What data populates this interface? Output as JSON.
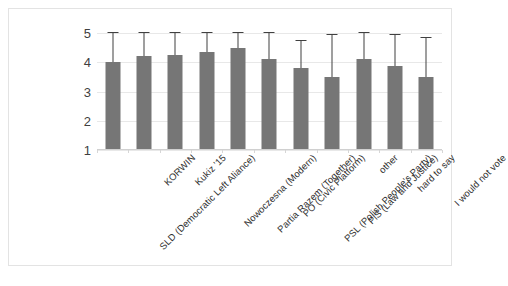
{
  "chart_data": {
    "type": "bar",
    "title": "",
    "subtitle": "",
    "xlabel": "",
    "ylabel": "",
    "ylim": [
      1,
      5
    ],
    "yticks": [
      "1",
      "2",
      "3",
      "4",
      "5"
    ],
    "grid": true,
    "legend": "none",
    "error_bars": "upper-only",
    "bar_color": "#767676",
    "error_bar_color": "#404040",
    "gridline_color": "#e8e8e8",
    "categories": [
      "SLD (Democratic Left Aliance)",
      "KORWIN",
      "Kukiz '15",
      "Nowoczesna (Modern)",
      "Partia Razem (Together)",
      "PO (Civic Platform)",
      "PSL (Polish People's Party)",
      "PiS (Law and Justice)",
      "other",
      "hard to say",
      "I would not vote"
    ],
    "values": [
      4.02,
      4.22,
      4.24,
      4.36,
      4.48,
      4.12,
      3.79,
      3.49,
      4.1,
      3.86,
      3.49
    ],
    "error_upper": [
      5.12,
      5.15,
      5.13,
      5.35,
      5.33,
      5.25,
      4.73,
      4.93,
      5.12,
      4.92,
      4.83
    ]
  }
}
